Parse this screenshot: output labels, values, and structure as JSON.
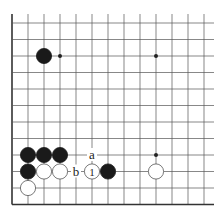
{
  "diagram": {
    "type": "go-board-fragment",
    "grid": {
      "columns": 13,
      "rows": 12,
      "x0": 12,
      "dx": 16,
      "y_bottom": 204.5,
      "dy": 16.5,
      "edges": [
        "left",
        "bottom"
      ],
      "line_color": "#555555",
      "edge_color": "#333333"
    },
    "star_points": [
      {
        "col": 3,
        "row": 9
      },
      {
        "col": 9,
        "row": 9
      },
      {
        "col": 9,
        "row": 3
      }
    ],
    "stones": [
      {
        "color": "black",
        "col": 2,
        "row": 9
      },
      {
        "color": "black",
        "col": 1,
        "row": 3
      },
      {
        "color": "black",
        "col": 2,
        "row": 3
      },
      {
        "color": "black",
        "col": 3,
        "row": 3
      },
      {
        "color": "black",
        "col": 1,
        "row": 2
      },
      {
        "color": "white",
        "col": 2,
        "row": 2
      },
      {
        "color": "white",
        "col": 3,
        "row": 2
      },
      {
        "color": "white",
        "col": 5,
        "row": 2,
        "label": "1"
      },
      {
        "color": "black",
        "col": 6,
        "row": 2
      },
      {
        "color": "white",
        "col": 1,
        "row": 1
      },
      {
        "color": "white",
        "col": 9,
        "row": 2
      }
    ],
    "labels": [
      {
        "text": "a",
        "col": 5,
        "row": 3
      },
      {
        "text": "b",
        "col": 4,
        "row": 2
      }
    ]
  }
}
